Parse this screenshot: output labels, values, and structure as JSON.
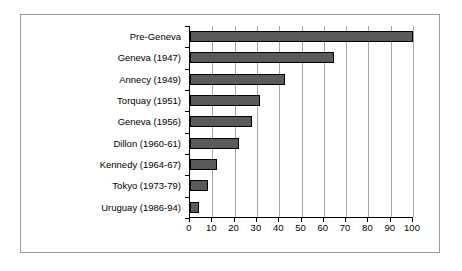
{
  "chart_data": {
    "type": "bar",
    "orientation": "horizontal",
    "title": "",
    "subtitle": "",
    "xlabel": "",
    "ylabel": "",
    "xlim": [
      0,
      100
    ],
    "xticks": [
      0,
      10,
      20,
      30,
      40,
      50,
      60,
      70,
      80,
      90,
      100
    ],
    "xtick_labels": [
      "0",
      "10",
      "20",
      "30",
      "40",
      "50",
      "60",
      "70",
      "80",
      "90",
      "100"
    ],
    "grid": "vertical",
    "legend": "none",
    "categories": [
      "Pre-Geneva",
      "Geneva (1947)",
      "Annecy (1949)",
      "Torquay (1951)",
      "Geneva (1956)",
      "Dillon (1960-61)",
      "Kennedy (1964-67)",
      "Tokyo (1973-79)",
      "Uruguay (1986-94)"
    ],
    "values": [
      100,
      64.5,
      42.5,
      31.5,
      28,
      22,
      12,
      8,
      4
    ],
    "series": [
      {
        "name": "Average tariff",
        "values": [
          100,
          64.5,
          42.5,
          31.5,
          28,
          22,
          12,
          8,
          4
        ]
      }
    ],
    "colors": {
      "bar_fill": "#5a5a5a",
      "bar_border": "#000000",
      "gridline": "#a6a6a6",
      "axis": "#000000",
      "frame": "#9a9a9a",
      "background": "#ffffff",
      "text": "#000000"
    }
  }
}
